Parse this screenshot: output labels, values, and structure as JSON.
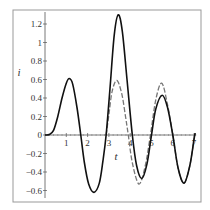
{
  "chart_data": {
    "type": "line",
    "title": "",
    "xlabel": "t",
    "ylabel": "i",
    "xlim": [
      0,
      7.1
    ],
    "ylim": [
      -0.66,
      1.33
    ],
    "xticks": [
      1,
      2,
      3,
      4,
      5,
      6,
      7
    ],
    "xtick_labels": [
      "1",
      "2",
      "3",
      "4",
      "5",
      "6",
      "7"
    ],
    "yticks": [
      -0.6,
      -0.4,
      -0.2,
      0,
      0.2,
      0.4,
      0.6,
      0.8,
      1,
      1.2
    ],
    "ytick_labels": [
      "−0.6",
      "−0.4",
      "−0.2",
      "0",
      "0.2",
      "0.4",
      "0.6",
      "0.8",
      "1",
      "1.2"
    ],
    "grid": false,
    "legend": "none",
    "series": [
      {
        "name": "solid",
        "style": "solid",
        "color": "#111111",
        "points": [
          [
            0,
            0
          ],
          [
            0.2,
            0.005
          ],
          [
            0.4,
            0.05
          ],
          [
            0.6,
            0.2
          ],
          [
            0.8,
            0.4
          ],
          [
            1.0,
            0.56
          ],
          [
            1.14,
            0.61
          ],
          [
            1.3,
            0.55
          ],
          [
            1.5,
            0.3
          ],
          [
            1.68,
            0
          ],
          [
            1.85,
            -0.3
          ],
          [
            2.05,
            -0.53
          ],
          [
            2.3,
            -0.62
          ],
          [
            2.55,
            -0.52
          ],
          [
            2.72,
            -0.28
          ],
          [
            2.87,
            0
          ],
          [
            3.05,
            0.5
          ],
          [
            3.25,
            1.08
          ],
          [
            3.44,
            1.3
          ],
          [
            3.63,
            1.12
          ],
          [
            3.85,
            0.6
          ],
          [
            4.1,
            0
          ],
          [
            4.3,
            -0.33
          ],
          [
            4.54,
            -0.47
          ],
          [
            4.78,
            -0.32
          ],
          [
            5.0,
            0
          ],
          [
            5.2,
            0.28
          ],
          [
            5.5,
            0.43
          ],
          [
            5.75,
            0.3
          ],
          [
            6.0,
            0
          ],
          [
            6.25,
            -0.36
          ],
          [
            6.53,
            -0.52
          ],
          [
            6.8,
            -0.33
          ],
          [
            7.0,
            -0.04
          ],
          [
            7.05,
            0.02
          ]
        ]
      },
      {
        "name": "dashed",
        "style": "dashed",
        "color": "#777777",
        "points": [
          [
            2.87,
            0
          ],
          [
            3.0,
            0.22
          ],
          [
            3.15,
            0.47
          ],
          [
            3.37,
            0.59
          ],
          [
            3.6,
            0.45
          ],
          [
            3.78,
            0.2
          ],
          [
            3.91,
            0
          ],
          [
            4.1,
            -0.3
          ],
          [
            4.41,
            -0.53
          ],
          [
            4.7,
            -0.34
          ],
          [
            4.95,
            0
          ],
          [
            5.2,
            0.38
          ],
          [
            5.48,
            0.56
          ],
          [
            5.75,
            0.33
          ],
          [
            6.0,
            0
          ],
          [
            6.25,
            -0.36
          ],
          [
            6.53,
            -0.52
          ],
          [
            6.8,
            -0.33
          ],
          [
            7.0,
            -0.04
          ],
          [
            7.05,
            0.02
          ]
        ]
      }
    ]
  }
}
